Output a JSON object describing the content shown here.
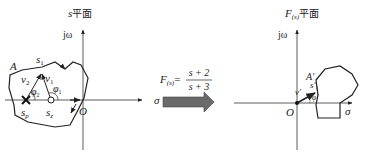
{
  "left_plane": {
    "title_var": "s",
    "title_cjk": "平面",
    "axis_imag": "jω",
    "axis_real": "σ",
    "origin": "O",
    "contour": "A",
    "point_s1": "s",
    "point_s1_sub": "1",
    "vec_v1": "v",
    "vec_v1_sub": "1",
    "vec_v2": "v",
    "vec_v2_sub": "2",
    "angle_phi1": "φ",
    "angle_phi1_sub": "1",
    "angle_phi2": "φ",
    "angle_phi2_sub": "2",
    "pole": "s",
    "pole_sub": "p",
    "zero": "s",
    "zero_sub": "z"
  },
  "mapping": {
    "func": "F",
    "func_sub": "(s)",
    "equals": "=",
    "numerator": "s + 2",
    "denominator": "s + 3",
    "arrow_color": "#666666"
  },
  "right_plane": {
    "title_var": "F",
    "title_sub": "(s)",
    "title_cjk": "平面",
    "axis_imag": "jω",
    "axis_real": "σ",
    "origin": "O",
    "contour": "A′",
    "point_s1": "s′",
    "point_s1_sub": "1",
    "vec_v": "v′",
    "angle_phi": "φ′"
  }
}
